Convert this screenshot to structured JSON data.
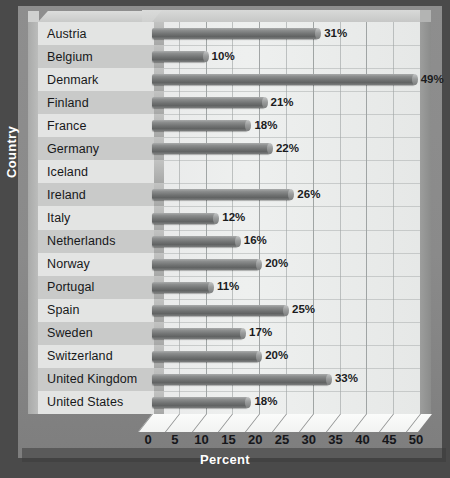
{
  "chart_data": {
    "type": "bar",
    "orientation": "horizontal",
    "title": "",
    "xlabel": "Percent",
    "ylabel": "Country",
    "xlim": [
      0,
      50
    ],
    "xticks": [
      0,
      5,
      10,
      15,
      20,
      25,
      30,
      35,
      40,
      45,
      50
    ],
    "grid": true,
    "legend": "none",
    "categories": [
      "Austria",
      "Belgium",
      "Denmark",
      "Finland",
      "France",
      "Germany",
      "Iceland",
      "Ireland",
      "Italy",
      "Netherlands",
      "Norway",
      "Portugal",
      "Spain",
      "Sweden",
      "Switzerland",
      "United Kingdom",
      "United States"
    ],
    "values": [
      31,
      10,
      49,
      21,
      18,
      22,
      null,
      26,
      12,
      16,
      20,
      11,
      25,
      17,
      20,
      33,
      18
    ],
    "value_labels": [
      "31%",
      "10%",
      "49%",
      "21%",
      "18%",
      "22%",
      "",
      "26%",
      "12%",
      "16%",
      "20%",
      "11%",
      "25%",
      "17%",
      "20%",
      "33%",
      "18%"
    ]
  },
  "colors": {
    "mat": "#4a4a4a",
    "frame": "#8a8a8a",
    "plot_panel": "#e9eaea",
    "bar": "#707272",
    "category_light": "#e3e4e3",
    "category_dark": "#c9cac9",
    "axis_title_text": "#ffffff",
    "tick_text": "#15161a"
  }
}
